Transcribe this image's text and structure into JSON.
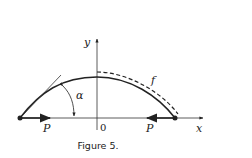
{
  "figure": {
    "caption": "Figure 5.",
    "labels": {
      "y_axis": "y",
      "x_axis": "x",
      "origin": "0",
      "curve": "f",
      "angle": "α",
      "force_left": "P",
      "force_right": "P"
    },
    "colors": {
      "ink": "#222222",
      "background": "#ffffff"
    }
  }
}
